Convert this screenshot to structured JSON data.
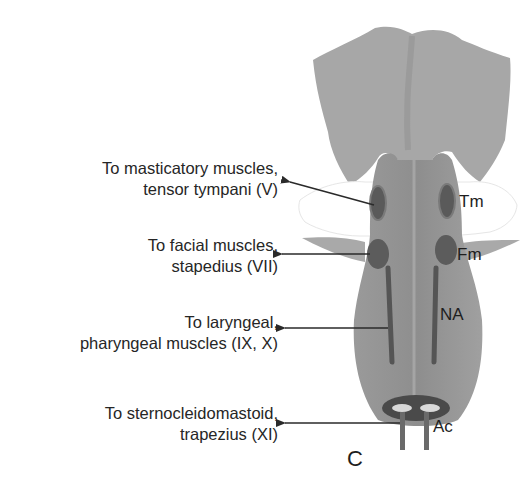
{
  "figure": {
    "panel_letter": "C",
    "colors": {
      "background": "#ffffff",
      "brainstem_fill": "#9c9c9c",
      "cerebellar_peduncle_fill": "#a6a6a6",
      "nucleus_fill": "#5c5c5c",
      "arrow": "#2a2a2a",
      "text": "#262626"
    }
  },
  "callouts": [
    {
      "line1": "To masticatory muscles,",
      "line2": "tensor tympani (V)"
    },
    {
      "line1": "To facial muscles,",
      "line2": "stapedius (VII)"
    },
    {
      "line1": "To laryngeal,",
      "line2": "pharyngeal muscles (IX, X)"
    },
    {
      "line1": "To sternocleidomastoid,",
      "line2": "trapezius (XI)"
    }
  ],
  "structures": [
    {
      "abbr": "Tm"
    },
    {
      "abbr": "Fm"
    },
    {
      "abbr": "NA"
    },
    {
      "abbr": "Ac"
    }
  ]
}
